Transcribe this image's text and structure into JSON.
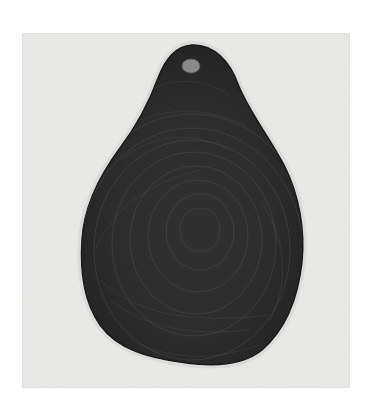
{
  "image": {
    "description": "Etching of a dark pear or teardrop-shaped form with swirling hatched lines on a pale grey plate",
    "colors": {
      "page_background": "#ffffff",
      "plate": "#e6e6e4",
      "plate_edge": "#d6d6d4",
      "form_dark": "#2a2a2a",
      "form_mid": "#3c3c3c",
      "hatch_light": "#6a6a6a",
      "hole": "#8a8a88"
    }
  }
}
